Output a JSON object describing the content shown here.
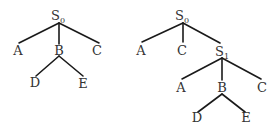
{
  "colors": {
    "edge": "#1a1a1a",
    "text": "#333333",
    "background": "#ffffff"
  },
  "trees": [
    {
      "name": "left-tree",
      "nodes": {
        "root": {
          "label": "S",
          "sub": "0"
        },
        "a": {
          "label": "A"
        },
        "b": {
          "label": "B"
        },
        "c": {
          "label": "C"
        },
        "d": {
          "label": "D"
        },
        "e": {
          "label": "E"
        }
      }
    },
    {
      "name": "right-tree",
      "nodes": {
        "root": {
          "label": "S",
          "sub": "0"
        },
        "a": {
          "label": "A"
        },
        "c": {
          "label": "C"
        },
        "s1": {
          "label": "S",
          "sub": "1"
        },
        "a2": {
          "label": "A"
        },
        "b2": {
          "label": "B"
        },
        "c2": {
          "label": "C"
        },
        "d": {
          "label": "D"
        },
        "e": {
          "label": "E"
        }
      }
    }
  ]
}
